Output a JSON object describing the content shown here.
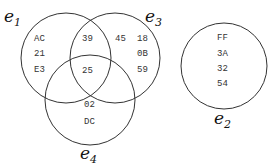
{
  "sets": [
    {
      "name": "e",
      "sub": "1",
      "cx": 66,
      "cy": 58,
      "r": 45,
      "lx": 6,
      "ly": 20
    },
    {
      "name": "e",
      "sub": "3",
      "cx": 115,
      "cy": 58,
      "r": 45,
      "lx": 147,
      "ly": 20
    },
    {
      "name": "e",
      "sub": "4",
      "cx": 90,
      "cy": 100,
      "r": 45,
      "lx": 80,
      "ly": 162
    },
    {
      "name": "e",
      "sub": "2",
      "cx": 224,
      "cy": 66,
      "r": 43,
      "lx": 215,
      "ly": 126
    }
  ],
  "regions": {
    "e1_only": [
      "AC",
      "21",
      "E3"
    ],
    "e1_e3": [
      "39"
    ],
    "e3_only_a": [
      "45"
    ],
    "e3_only_b": [
      "18",
      "0B",
      "59"
    ],
    "e1_e3_e4": [
      "25"
    ],
    "e4_only": [
      "02",
      "DC"
    ],
    "e2_only": [
      "FF",
      "3A",
      "32",
      "54"
    ]
  }
}
